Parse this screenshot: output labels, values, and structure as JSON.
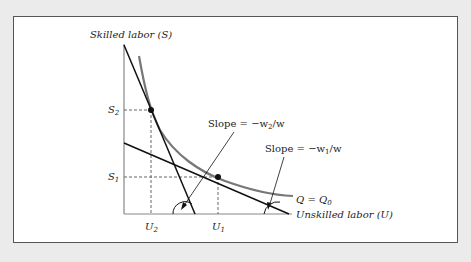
{
  "diagram": {
    "y_axis_label": "Skilled labor (S)",
    "x_axis_label": "Unskilled labor (U)",
    "isoquant_label": "Q = Q",
    "isoquant_sub": "0",
    "ticks": {
      "s2": {
        "main": "S",
        "sub": "2"
      },
      "s1": {
        "main": "S",
        "sub": "1"
      },
      "u2": {
        "main": "U",
        "sub": "2"
      },
      "u1": {
        "main": "U",
        "sub": "1"
      }
    },
    "slope_steep": {
      "prefix": "Slope = −w",
      "sub": "2",
      "suffix": "/w"
    },
    "slope_flat": {
      "prefix": "Slope = −w",
      "sub": "1",
      "suffix": "/w"
    },
    "colors": {
      "curve": "#777777",
      "lines": "#111111",
      "axes": "#888888",
      "dashed": "#666666",
      "frame_bg": "#ffffff",
      "page_bg": "#ebebeb"
    }
  }
}
